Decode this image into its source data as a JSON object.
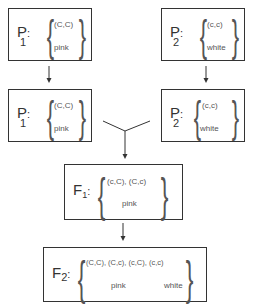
{
  "diagram": {
    "title": "",
    "nodes": [
      {
        "id": "p1_top",
        "label_main": "P",
        "label_sub": "1",
        "genotypes": "(C,C)",
        "phenotypes": [
          "pink"
        ]
      },
      {
        "id": "p2_top",
        "label_main": "P",
        "label_sub": "2",
        "genotypes": "(c,c)",
        "phenotypes": [
          "white"
        ]
      },
      {
        "id": "p1_mid",
        "label_main": "P",
        "label_sub": "1",
        "genotypes": "(C,C)",
        "phenotypes": [
          "pink"
        ]
      },
      {
        "id": "p2_mid",
        "label_main": "P",
        "label_sub": "2",
        "genotypes": "(c,c)",
        "phenotypes": [
          "white"
        ]
      },
      {
        "id": "f1",
        "label_main": "F",
        "label_sub": "1",
        "genotypes": "(c,C), (C,c)",
        "phenotypes": [
          "pink"
        ]
      },
      {
        "id": "f2",
        "label_main": "F",
        "label_sub": "2",
        "genotypes": "(C,C), (C,c), (c,C), (c,c)",
        "phenotypes": [
          "pink",
          "white"
        ]
      }
    ],
    "edges": [
      {
        "from": "p1_top",
        "to": "p1_mid"
      },
      {
        "from": "p2_top",
        "to": "p2_mid"
      },
      {
        "from": "p1_mid",
        "to": "f1"
      },
      {
        "from": "p2_mid",
        "to": "f1"
      },
      {
        "from": "f1",
        "to": "f2"
      }
    ],
    "colon": ":",
    "brace_open": "{",
    "brace_close": "}",
    "colors": {
      "line": "#333333",
      "text": "#555555"
    }
  }
}
